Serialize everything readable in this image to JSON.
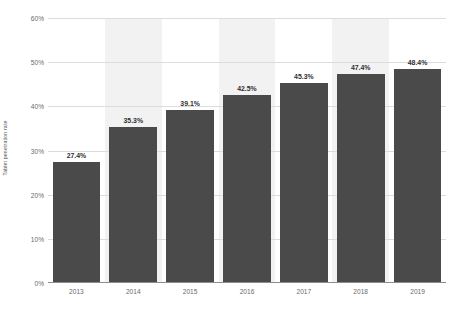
{
  "chart_data": {
    "type": "bar",
    "title": "",
    "subtitle": "",
    "xlabel": "",
    "ylabel": "Tablet penetration rate",
    "categories": [
      "2013",
      "2014",
      "2015",
      "2016",
      "2017",
      "2018",
      "2019"
    ],
    "values": [
      27.4,
      35.3,
      39.1,
      42.5,
      45.3,
      47.4,
      48.4
    ],
    "data_labels": [
      "27.4%",
      "35.3%",
      "39.1%",
      "42.5%",
      "45.3%",
      "47.4%",
      "48.4%"
    ],
    "ylim": [
      0,
      60
    ],
    "ytick_values": [
      0,
      10,
      20,
      30,
      40,
      50,
      60
    ],
    "ytick_labels": [
      "0%",
      "10%",
      "20%",
      "30%",
      "40%",
      "50%",
      "60%"
    ],
    "grid": true,
    "legend": null,
    "legend_position": "none",
    "series": [
      {
        "name": "Tablet penetration rate",
        "values": [
          27.4,
          35.3,
          39.1,
          42.5,
          45.3,
          47.4,
          48.4
        ]
      }
    ],
    "colors": {
      "bar": "#4a4a4a",
      "band": "#f2f2f2",
      "gridline": "#dcdcdc",
      "axis": "#8c8c8c",
      "tick_text": "#6a6a6a",
      "label_text": "#2f2f2f",
      "background": "#ffffff"
    },
    "banded_categories": [
      "2014",
      "2016",
      "2018"
    ]
  }
}
